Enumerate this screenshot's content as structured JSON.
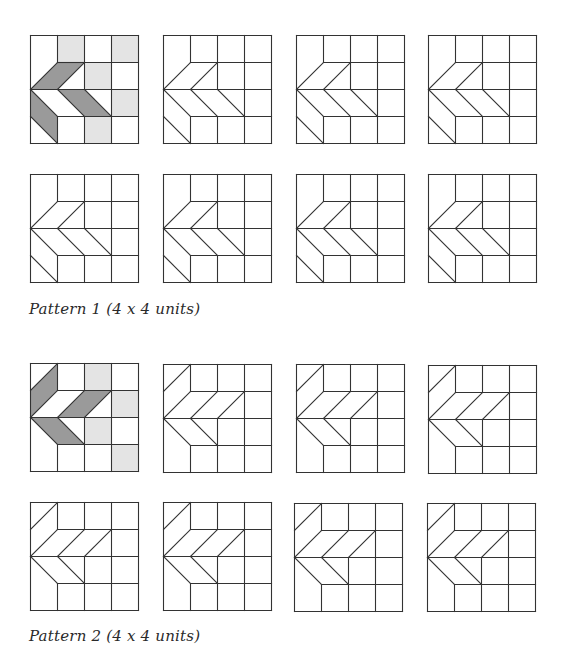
{
  "figure": {
    "colors": {
      "line": "#333333",
      "dark": "#9a9a9a",
      "light": "#e4e4e4",
      "background": "#ffffff"
    },
    "cell_px": 27,
    "grid_units": 4
  },
  "pattern1": {
    "caption": "Pattern 1 (4 x 4 units)",
    "lines": {
      "a": [
        [
          0,
          2,
          1,
          1
        ],
        [
          1,
          1,
          2,
          1
        ],
        [
          1,
          2,
          2,
          1
        ],
        [
          0,
          2,
          1,
          3
        ],
        [
          1,
          2,
          2,
          3
        ],
        [
          2,
          2,
          3,
          3
        ],
        [
          0,
          3,
          1,
          4
        ]
      ],
      "b": [
        [
          0,
          2,
          1,
          1
        ],
        [
          1,
          2,
          2,
          1
        ],
        [
          0,
          2,
          1,
          3
        ],
        [
          1,
          2,
          2,
          3
        ],
        [
          2,
          2,
          3,
          3
        ],
        [
          0,
          3,
          1,
          4
        ]
      ],
      "c": [
        [
          0,
          2,
          1,
          1
        ],
        [
          1,
          2,
          2,
          1
        ],
        [
          0,
          2,
          1,
          3
        ],
        [
          1,
          2,
          2,
          3
        ],
        [
          2,
          2,
          3,
          3
        ],
        [
          0,
          3,
          1,
          4
        ]
      ],
      "d": [
        [
          0,
          2,
          1,
          1
        ],
        [
          1,
          2,
          2,
          1
        ],
        [
          0,
          2,
          1,
          3
        ],
        [
          1,
          2,
          2,
          3
        ],
        [
          2,
          2,
          3,
          3
        ],
        [
          0,
          3,
          1,
          4
        ]
      ]
    },
    "grids": [
      {
        "id": "p1-r1-c1",
        "shaded": true,
        "light": [
          [
            1,
            0
          ],
          [
            3,
            0
          ],
          [
            2,
            1
          ],
          [
            3,
            2
          ],
          [
            2,
            3
          ]
        ],
        "dark": [
          [
            [
              0,
              2
            ],
            [
              1,
              1
            ],
            [
              2,
              1
            ],
            [
              1,
              2
            ]
          ],
          [
            [
              1,
              2
            ],
            [
              2,
              2
            ],
            [
              3,
              3
            ],
            [
              2,
              3
            ]
          ],
          [
            [
              0,
              2
            ],
            [
              0,
              3
            ],
            [
              1,
              4
            ],
            [
              1,
              3
            ]
          ]
        ],
        "missing_h": [
          [
            0,
            1
          ],
          [
            1,
            2
          ],
          [
            1,
            3
          ],
          [
            0,
            3
          ]
        ],
        "missing_v": [
          [
            1,
            0
          ],
          [
            1,
            1
          ],
          [
            2,
            1
          ]
        ]
      },
      {
        "id": "p1-r1-c2",
        "shaded": false,
        "light": [],
        "dark": [],
        "missing_h": [
          [
            0,
            1
          ],
          [
            1,
            2
          ],
          [
            2,
            2
          ],
          [
            0,
            3
          ]
        ],
        "missing_v": [
          [
            1,
            0
          ],
          [
            1,
            1
          ],
          [
            2,
            1
          ]
        ]
      },
      {
        "id": "p1-r1-c3",
        "shaded": false,
        "light": [],
        "dark": [],
        "missing_h": [
          [
            0,
            1
          ],
          [
            1,
            2
          ],
          [
            2,
            2
          ],
          [
            0,
            3
          ]
        ],
        "missing_v": [
          [
            1,
            0
          ],
          [
            1,
            1
          ],
          [
            2,
            1
          ]
        ]
      },
      {
        "id": "p1-r1-c4",
        "shaded": false,
        "light": [],
        "dark": [],
        "missing_h": [
          [
            0,
            1
          ],
          [
            1,
            2
          ],
          [
            2,
            2
          ],
          [
            0,
            3
          ]
        ],
        "missing_v": [
          [
            1,
            0
          ],
          [
            1,
            1
          ],
          [
            2,
            1
          ]
        ]
      },
      {
        "id": "p1-r2-c1",
        "shaded": false,
        "light": [],
        "dark": [],
        "missing_h": [
          [
            0,
            1
          ],
          [
            1,
            2
          ],
          [
            2,
            2
          ],
          [
            0,
            3
          ]
        ],
        "missing_v": [
          [
            1,
            0
          ],
          [
            1,
            1
          ],
          [
            2,
            1
          ]
        ]
      },
      {
        "id": "p1-r2-c2",
        "shaded": false,
        "light": [],
        "dark": [],
        "missing_h": [
          [
            0,
            1
          ],
          [
            1,
            2
          ],
          [
            2,
            2
          ],
          [
            0,
            3
          ]
        ],
        "missing_v": [
          [
            1,
            0
          ],
          [
            1,
            1
          ],
          [
            2,
            1
          ]
        ]
      },
      {
        "id": "p1-r2-c3",
        "shaded": false,
        "light": [],
        "dark": [],
        "missing_h": [
          [
            0,
            1
          ],
          [
            1,
            2
          ],
          [
            2,
            2
          ],
          [
            0,
            3
          ]
        ],
        "missing_v": [
          [
            1,
            0
          ],
          [
            1,
            1
          ],
          [
            2,
            1
          ]
        ]
      },
      {
        "id": "p1-r2-c4",
        "shaded": false,
        "light": [],
        "dark": [],
        "missing_h": [
          [
            0,
            1
          ],
          [
            1,
            2
          ],
          [
            2,
            2
          ],
          [
            0,
            3
          ]
        ],
        "missing_v": [
          [
            1,
            0
          ],
          [
            1,
            1
          ],
          [
            2,
            1
          ]
        ]
      }
    ]
  },
  "pattern2": {
    "caption": "Pattern 2 (4 x 4 units)",
    "lines": [
      [
        0,
        1,
        1,
        0
      ],
      [
        0,
        2,
        1,
        1
      ],
      [
        1,
        2,
        2,
        1
      ],
      [
        2,
        2,
        3,
        1
      ],
      [
        0,
        2,
        1,
        3
      ],
      [
        1,
        2,
        2,
        3
      ]
    ],
    "grids": [
      {
        "id": "p2-r1-c1",
        "shaded": true,
        "light": [
          [
            2,
            0
          ],
          [
            3,
            1
          ],
          [
            2,
            2
          ],
          [
            3,
            3
          ]
        ],
        "dark": [
          [
            [
              0,
              1
            ],
            [
              1,
              0
            ],
            [
              1,
              1
            ],
            [
              0,
              2
            ]
          ],
          [
            [
              1,
              2
            ],
            [
              2,
              1
            ],
            [
              3,
              1
            ],
            [
              2,
              2
            ]
          ],
          [
            [
              0,
              2
            ],
            [
              1,
              2
            ],
            [
              2,
              3
            ],
            [
              1,
              3
            ]
          ]
        ]
      },
      {
        "id": "p2-r1-c2",
        "shaded": false,
        "light": [],
        "dark": []
      },
      {
        "id": "p2-r1-c3",
        "shaded": false,
        "light": [],
        "dark": []
      },
      {
        "id": "p2-r1-c4",
        "shaded": false,
        "light": [],
        "dark": []
      },
      {
        "id": "p2-r2-c1",
        "shaded": false,
        "light": [],
        "dark": []
      },
      {
        "id": "p2-r2-c2",
        "shaded": false,
        "light": [],
        "dark": []
      },
      {
        "id": "p2-r2-c3",
        "shaded": false,
        "light": [],
        "dark": []
      },
      {
        "id": "p2-r2-c4",
        "shaded": false,
        "light": [],
        "dark": []
      }
    ]
  }
}
